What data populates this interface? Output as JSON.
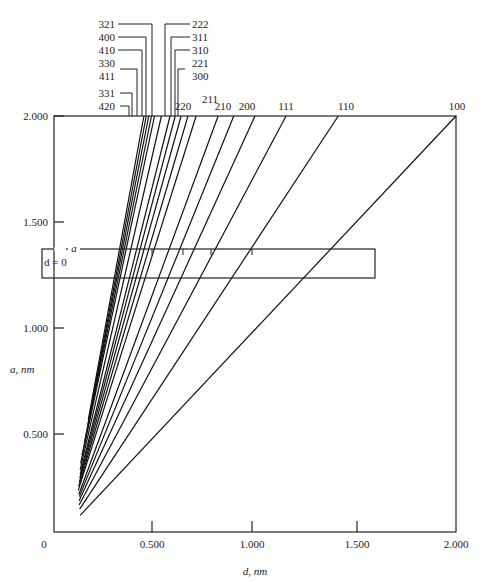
{
  "chart_data": {
    "type": "line",
    "title": "",
    "xlabel": "d, nm",
    "ylabel": "a, nm",
    "xlim": [
      0,
      2.0
    ],
    "ylim": [
      0,
      2.0
    ],
    "x_ticks": [
      "0",
      "0.500",
      "1.000",
      "1.500",
      "2.000"
    ],
    "y_ticks": [
      "0.500",
      "1.000",
      "1.500",
      "2.000"
    ],
    "grid": false,
    "relation": "d = a / sqrt(h^2 + k^2 + l^2)",
    "series": [
      {
        "name": "100",
        "N": 1,
        "a_start": 0.08,
        "a_end": 2.0,
        "d_at_a2": 2.0
      },
      {
        "name": "110",
        "N": 2,
        "a_start": 0.11,
        "a_end": 2.0,
        "d_at_a2": 1.414
      },
      {
        "name": "111",
        "N": 3,
        "a_start": 0.13,
        "a_end": 2.0,
        "d_at_a2": 1.155
      },
      {
        "name": "200",
        "N": 4,
        "a_start": 0.15,
        "a_end": 2.0,
        "d_at_a2": 1.0
      },
      {
        "name": "210",
        "N": 5,
        "a_start": 0.17,
        "a_end": 2.0,
        "d_at_a2": 0.894
      },
      {
        "name": "211",
        "N": 6,
        "a_start": 0.18,
        "a_end": 2.0,
        "d_at_a2": 0.816
      },
      {
        "name": "220",
        "N": 8,
        "a_start": 0.2,
        "a_end": 2.0,
        "d_at_a2": 0.707
      },
      {
        "name": "221/300",
        "N": 9,
        "a_start": 0.22,
        "a_end": 2.0,
        "d_at_a2": 0.667
      },
      {
        "name": "310",
        "N": 10,
        "a_start": 0.24,
        "a_end": 2.0,
        "d_at_a2": 0.632
      },
      {
        "name": "311",
        "N": 11,
        "a_start": 0.26,
        "a_end": 2.0,
        "d_at_a2": 0.603
      },
      {
        "name": "222",
        "N": 12,
        "a_start": 0.28,
        "a_end": 2.0,
        "d_at_a2": 0.577
      },
      {
        "name": "321",
        "N": 14,
        "a_start": 0.3,
        "a_end": 2.0,
        "d_at_a2": 0.535
      },
      {
        "name": "400",
        "N": 16,
        "a_start": 0.33,
        "a_end": 2.0,
        "d_at_a2": 0.5
      },
      {
        "name": "410",
        "N": 17,
        "a_start": 0.37,
        "a_end": 2.0,
        "d_at_a2": 0.485
      },
      {
        "name": "330/411",
        "N": 18,
        "a_start": 0.43,
        "a_end": 2.0,
        "d_at_a2": 0.471
      },
      {
        "name": "331",
        "N": 19,
        "a_start": 0.52,
        "a_end": 2.0,
        "d_at_a2": 0.459
      },
      {
        "name": "420",
        "N": 20,
        "a_start": 0.54,
        "a_end": 2.0,
        "d_at_a2": 0.447
      }
    ],
    "annotations": {
      "ruler_label": "a",
      "ruler_origin": "d = 0",
      "ruler_box": {
        "a_top": 1.39,
        "a_bottom": 1.25,
        "d_right": 1.6
      }
    },
    "top_labels": {
      "left_group": [
        "321",
        "400",
        "410",
        "330",
        "411",
        "331",
        "420"
      ],
      "right_group": [
        "222",
        "311",
        "310",
        "221",
        "300"
      ],
      "inline": [
        "220",
        "211",
        "210",
        "200",
        "111",
        "110",
        "100"
      ]
    }
  }
}
